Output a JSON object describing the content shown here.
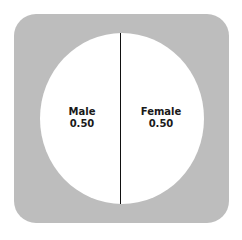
{
  "chart_data": {
    "type": "pie",
    "title": "",
    "categories": [
      "Male",
      "Female"
    ],
    "values": [
      0.5,
      0.5
    ],
    "labels": [
      {
        "name": "Male",
        "value": "0.50"
      },
      {
        "name": "Female",
        "value": "0.50"
      }
    ],
    "colors": {
      "background_frame": "#bdbdbd",
      "slice_fill": "#ffffff",
      "divider": "#111111"
    },
    "legend": "none",
    "grid": false
  }
}
